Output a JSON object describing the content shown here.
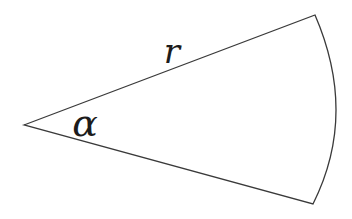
{
  "figure": {
    "labels": {
      "radius": "r",
      "angle": "α"
    },
    "colors": {
      "stroke": "#3a3a3a",
      "background": "#ffffff",
      "text": "#1c1c1c"
    },
    "geometry": {
      "apex": [
        24,
        125
      ],
      "top_corner": [
        315,
        15
      ],
      "bottom_corner": [
        313,
        204
      ],
      "arc_midpoint": [
        336,
        112
      ],
      "stroke_width": 1.3
    }
  }
}
